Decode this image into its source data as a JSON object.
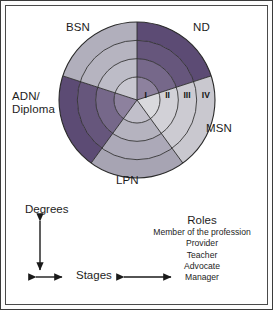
{
  "figure": {
    "background_color": "#ffffff",
    "frame_color": "#3b3b3b"
  },
  "wheel": {
    "type": "sector-ring-wheel",
    "ring_count": 4,
    "sector_count": 5,
    "outline_color": "#2a2a2a",
    "sectors": [
      {
        "id": "nd",
        "label": "ND",
        "color": "#5c4b74",
        "tone": "dark",
        "start_deg": -90,
        "end_deg": -18
      },
      {
        "id": "msn",
        "label": "MSN",
        "color": "#c9c8cf",
        "tone": "light",
        "start_deg": -18,
        "end_deg": 54
      },
      {
        "id": "lpn",
        "label": "LPN",
        "color": "#a7a4b3",
        "tone": "medium",
        "start_deg": 54,
        "end_deg": 126
      },
      {
        "id": "adn",
        "label": "ADN/\nDiploma",
        "color": "#5c4b74",
        "tone": "dark",
        "start_deg": 126,
        "end_deg": 198
      },
      {
        "id": "bsn",
        "label": "BSN",
        "color": "#b1afbc",
        "tone": "light",
        "start_deg": 198,
        "end_deg": 270
      }
    ],
    "stages": [
      {
        "numeral": "I",
        "ring": 1
      },
      {
        "numeral": "II",
        "ring": 2
      },
      {
        "numeral": "III",
        "ring": 3
      },
      {
        "numeral": "IV",
        "ring": 4
      }
    ]
  },
  "axes": {
    "vertical_label": "Degrees",
    "horizontal_label": "Stages",
    "arrow_color": "#1a1a1a"
  },
  "roles": {
    "title": "Roles",
    "items": [
      "Member of the profession",
      "Provider",
      "Teacher",
      "Advocate",
      "Manager"
    ]
  }
}
